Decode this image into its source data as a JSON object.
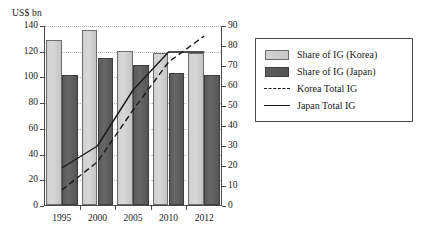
{
  "chart_data": {
    "type": "bar",
    "title": "",
    "ylabel": "US$ bn",
    "xlabel": "",
    "categories": [
      "1995",
      "2000",
      "2005",
      "2010",
      "2012"
    ],
    "ylim": [
      0,
      140
    ],
    "y_ticks": [
      0,
      20,
      40,
      60,
      80,
      100,
      120,
      140
    ],
    "y2lim": [
      0,
      90
    ],
    "y2_ticks": [
      0,
      10,
      20,
      30,
      40,
      50,
      60,
      70,
      80,
      90
    ],
    "grid": true,
    "legend_position": "right",
    "series": [
      {
        "name": "Share of IG (Korea)",
        "type": "bar",
        "axis": "left",
        "color": "#d2d2d2",
        "values": [
          128,
          136,
          119.5,
          118,
          118
        ]
      },
      {
        "name": "Share of IG (Japan)",
        "type": "bar",
        "axis": "left",
        "color": "#5b5b5b",
        "values": [
          101,
          114,
          109,
          102.5,
          101
        ]
      },
      {
        "name": "Korea Total IG",
        "type": "line",
        "style": "dashed",
        "axis": "right",
        "color": "#1a1a1a",
        "values": [
          8,
          22,
          48,
          72,
          85
        ]
      },
      {
        "name": "Japan Total IG",
        "type": "line",
        "style": "solid",
        "axis": "right",
        "color": "#1a1a1a",
        "values": [
          19,
          30,
          58,
          77,
          77
        ]
      }
    ]
  },
  "legend": {
    "items": [
      {
        "label": "Share of IG (Korea)",
        "key": "swatch-light"
      },
      {
        "label": "Share of IG (Japan)",
        "key": "swatch-dark"
      },
      {
        "label": "Korea Total IG",
        "key": "line-dashed"
      },
      {
        "label": "Japan Total IG",
        "key": "line-solid"
      }
    ]
  }
}
